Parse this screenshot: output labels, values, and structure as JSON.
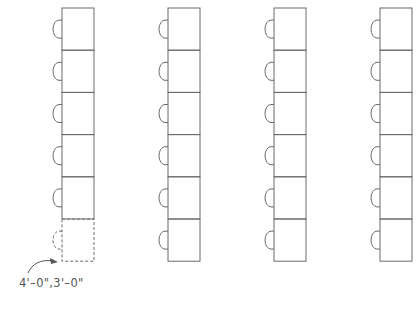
{
  "diagram": {
    "title": "",
    "columns": [
      {
        "id": "column-1",
        "seats": 6,
        "dashed_seats": [
          6
        ]
      },
      {
        "id": "column-2",
        "seats": 6,
        "dashed_seats": []
      },
      {
        "id": "column-3",
        "seats": 6,
        "dashed_seats": []
      },
      {
        "id": "column-4",
        "seats": 6,
        "dashed_seats": []
      }
    ],
    "annotation": {
      "text": "4'–0\",3'–0\"",
      "points_to": "column-1 seat 6"
    },
    "colors": {
      "line": "#6a6a6a",
      "background": "#ffffff"
    }
  }
}
